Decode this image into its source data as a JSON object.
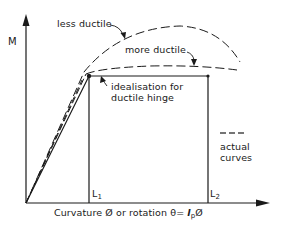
{
  "diagram": {
    "y_axis_label": "M",
    "x_axis_label": "Curvature Ø or rotation θ= ",
    "x_axis_label_lp": "l",
    "x_axis_label_lp_sub": "p",
    "x_axis_label_tail": "Ø",
    "curve_labels": {
      "less_ductile": "less ductile",
      "more_ductile": "more ductile",
      "idealisation_line1": "idealisation for",
      "idealisation_line2": "ductile hinge"
    },
    "legend": {
      "symbol": "— — —",
      "line1": "actual",
      "line2": "curves"
    },
    "markers": {
      "L1": "L",
      "L1_sub": "1",
      "L2": "L",
      "L2_sub": "2"
    },
    "colors": {
      "line": "#1a1a1a",
      "background": "#ffffff"
    }
  }
}
